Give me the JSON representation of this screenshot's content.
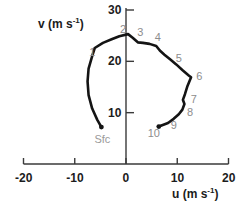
{
  "chart_data": {
    "type": "line",
    "title": "",
    "subtitle": "",
    "xlabel": "u (m s-1)",
    "ylabel": "v (m s-1)",
    "xlabel_base": "u (m s",
    "xlabel_sup": "-1",
    "xlabel_tail": ")",
    "ylabel_base": "v (m s",
    "ylabel_sup": "-1",
    "ylabel_tail": ")",
    "xlim": [
      -20,
      20
    ],
    "ylim": [
      0,
      30
    ],
    "xticks": [
      -20,
      -10,
      0,
      10,
      20
    ],
    "xtick_labels": [
      "-20",
      "-10",
      "0",
      "10",
      "20"
    ],
    "yticks": [
      10,
      20,
      30
    ],
    "ytick_labels": [
      "10",
      "20",
      "30"
    ],
    "grid": false,
    "legend": "none",
    "series": [
      {
        "name": "hodograph",
        "line_color": "#141414",
        "points": [
          {
            "u": -4.8,
            "v": 7.2
          },
          {
            "u": -5.6,
            "v": 8.6
          },
          {
            "u": -6.6,
            "v": 10.8
          },
          {
            "u": -7.3,
            "v": 13.4
          },
          {
            "u": -7.5,
            "v": 16.1
          },
          {
            "u": -7.3,
            "v": 18.6
          },
          {
            "u": -6.6,
            "v": 21.0
          },
          {
            "u": -6.1,
            "v": 22.6
          },
          {
            "u": -4.5,
            "v": 23.6
          },
          {
            "u": -2.8,
            "v": 24.3
          },
          {
            "u": -1.3,
            "v": 24.9
          },
          {
            "u": 0.4,
            "v": 25.3
          },
          {
            "u": 1.3,
            "v": 24.6
          },
          {
            "u": 2.3,
            "v": 23.7
          },
          {
            "u": 3.3,
            "v": 23.6
          },
          {
            "u": 4.6,
            "v": 23.4
          },
          {
            "u": 5.9,
            "v": 23.0
          },
          {
            "u": 6.6,
            "v": 22.1
          },
          {
            "u": 7.5,
            "v": 21.3
          },
          {
            "u": 8.6,
            "v": 20.4
          },
          {
            "u": 9.8,
            "v": 19.4
          },
          {
            "u": 11.1,
            "v": 18.2
          },
          {
            "u": 12.3,
            "v": 17.2
          },
          {
            "u": 12.7,
            "v": 16.9
          },
          {
            "u": 12.0,
            "v": 15.2
          },
          {
            "u": 11.5,
            "v": 13.6
          },
          {
            "u": 11.1,
            "v": 12.5
          },
          {
            "u": 11.4,
            "v": 11.7
          },
          {
            "u": 11.0,
            "v": 10.6
          },
          {
            "u": 10.3,
            "v": 9.7
          },
          {
            "u": 9.3,
            "v": 8.8
          },
          {
            "u": 8.2,
            "v": 8.0
          },
          {
            "u": 6.4,
            "v": 7.3
          }
        ]
      }
    ],
    "point_labels": [
      {
        "label": "1",
        "u": -6.6,
        "v": 21.6
      },
      {
        "label": "2",
        "u": -0.6,
        "v": 26.1
      },
      {
        "label": "3",
        "u": 2.8,
        "v": 25.6
      },
      {
        "label": "4",
        "u": 6.2,
        "v": 24.6
      },
      {
        "label": "5",
        "u": 10.3,
        "v": 20.4
      },
      {
        "label": "6",
        "u": 14.3,
        "v": 16.9
      },
      {
        "label": "7",
        "u": 13.2,
        "v": 12.5
      },
      {
        "label": "8",
        "u": 12.5,
        "v": 10.0
      },
      {
        "label": "9",
        "u": 9.3,
        "v": 7.5
      },
      {
        "label": "10",
        "u": 5.4,
        "v": 5.9
      }
    ],
    "annotations": [
      {
        "label": "Sfc",
        "u": -4.6,
        "v": 4.6,
        "color": "#9a9a9a"
      }
    ],
    "endpoints": [
      {
        "name": "sfc-endpoint",
        "u": -4.8,
        "v": 7.2
      },
      {
        "name": "top-endpoint",
        "u": 6.4,
        "v": 7.3
      }
    ]
  }
}
